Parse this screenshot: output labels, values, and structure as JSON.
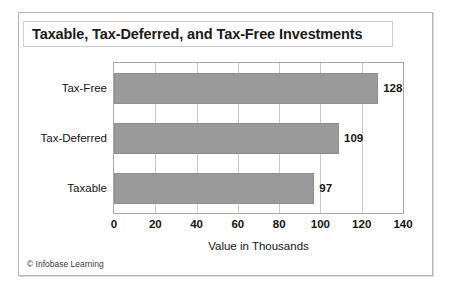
{
  "chart_data": {
    "type": "bar",
    "orientation": "horizontal",
    "title": "Taxable, Tax-Deferred, and Tax-Free Investments",
    "xlabel": "Value in Thousands",
    "ylabel": "",
    "categories": [
      "Taxable",
      "Tax-Deferred",
      "Tax-Free"
    ],
    "values": [
      97,
      109,
      128
    ],
    "data_labels": [
      "97",
      "109",
      "128"
    ],
    "xlim": [
      0,
      140
    ],
    "xticks": [
      0,
      20,
      40,
      60,
      80,
      100,
      120,
      140
    ],
    "xtick_labels": [
      "0",
      "20",
      "40",
      "60",
      "80",
      "100",
      "120",
      "140"
    ],
    "grid": "vertical",
    "legend": "none",
    "bar_color": "#9a9a9a",
    "plot_background": "#ffffff",
    "gridline_color": "#c9c9c9",
    "axis_color": "#a8a8a8"
  },
  "footer": {
    "copyright": "© Infobase Learning"
  }
}
